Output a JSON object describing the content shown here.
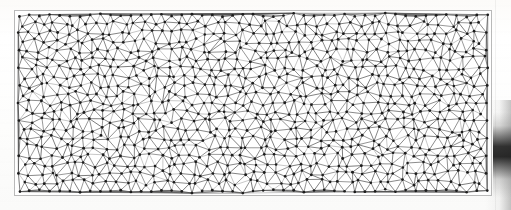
{
  "figure": {
    "kind": "unstructured-triangular-mesh",
    "caption": "",
    "frame": {
      "x": 14,
      "y": 10,
      "width": 478,
      "height": 186,
      "border_color": "#b9b9b9",
      "fill_color": "#ffffff"
    },
    "canvas": {
      "width": 511,
      "height": 210,
      "background_color": "#fdfdfc"
    }
  },
  "chart_data": {
    "type": "scatter",
    "title": "",
    "subtitle": "",
    "xlabel": "",
    "ylabel": "",
    "grid": false,
    "legend": null,
    "xlim": [
      0,
      478
    ],
    "ylim": [
      0,
      186
    ],
    "mesh": {
      "node_count": 612,
      "nominal_spacing": 10.2,
      "jitter": 0.34,
      "boundary_wave_amplitude": 2.6,
      "node_radius": 1.35,
      "node_color": "#1c1c1c",
      "edge_color": "#4a4a4a",
      "edge_width": 0.55,
      "edge_color_light": "#9a9a9a",
      "seed": 20240517
    }
  },
  "artifacts": {
    "edge_shadow": {
      "name": "page-edge-shadow",
      "color": "#232323",
      "x": 493,
      "y": 112,
      "width": 18,
      "height": 86
    },
    "scan_banding": {
      "name": "horizontal-scan-banding",
      "opacity": 0.3
    }
  }
}
